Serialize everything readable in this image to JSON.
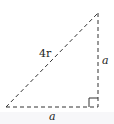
{
  "diagram": {
    "type": "right-triangle",
    "line_style": "dashed",
    "line_color": "#333333",
    "labels": {
      "hypotenuse": "4r",
      "vertical_leg": "a",
      "horizontal_leg": "a"
    },
    "right_angle_marker": true
  }
}
